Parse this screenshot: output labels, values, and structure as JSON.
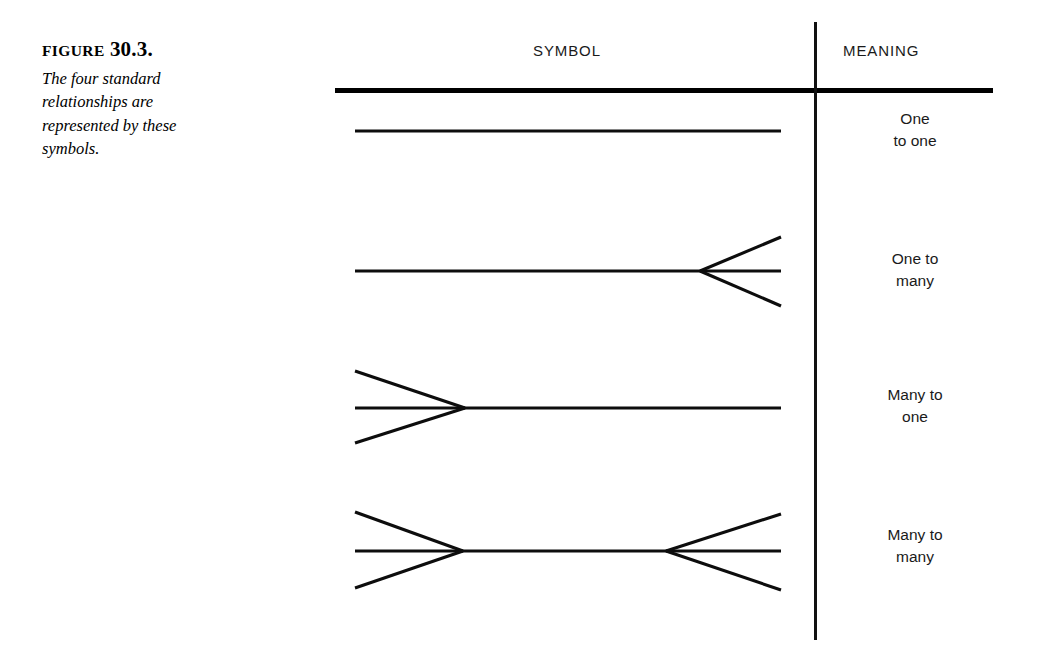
{
  "figure": {
    "label_word": "FIGURE",
    "number": "30.3.",
    "caption": "The four standard relationships are represented by these symbols."
  },
  "table": {
    "headers": {
      "symbol": "SYMBOL",
      "meaning": "MEANING"
    },
    "rows": [
      {
        "symbol_type": "one-to-one",
        "meaning_line1": "One",
        "meaning_line2": "to one"
      },
      {
        "symbol_type": "one-to-many",
        "meaning_line1": "One to",
        "meaning_line2": "many"
      },
      {
        "symbol_type": "many-to-one",
        "meaning_line1": "Many to",
        "meaning_line2": "one"
      },
      {
        "symbol_type": "many-to-many",
        "meaning_line1": "Many to",
        "meaning_line2": "many"
      }
    ]
  },
  "colors": {
    "ink": "#0d0d0d",
    "page": "#ffffff"
  }
}
